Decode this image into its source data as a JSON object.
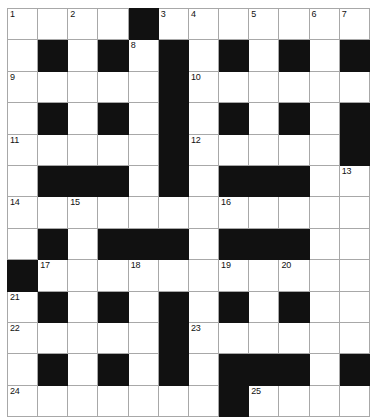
{
  "puzzle": {
    "title": "Crossword Grid",
    "columns": 12,
    "rows": 12,
    "block_color": "#111111",
    "cell_color": "#ffffff",
    "grid_line_color": "#a8a8a8",
    "number_color": "#111111",
    "numbers_visible": [
      1,
      2,
      3,
      4,
      5,
      6,
      7,
      8,
      9,
      10,
      11,
      12,
      13,
      14,
      15,
      16,
      17,
      18,
      19,
      20,
      21,
      22,
      23,
      24,
      25
    ],
    "grid": [
      [
        {
          "type": "white",
          "number": 1
        },
        {
          "type": "white"
        },
        {
          "type": "white",
          "number": 2
        },
        {
          "type": "white"
        },
        {
          "type": "block"
        },
        {
          "type": "white",
          "number": 3
        },
        {
          "type": "white",
          "number": 4
        },
        {
          "type": "white"
        },
        {
          "type": "white",
          "number": 5
        },
        {
          "type": "white"
        },
        {
          "type": "white",
          "number": 6
        },
        {
          "type": "white",
          "number": 7
        }
      ],
      [
        {
          "type": "white"
        },
        {
          "type": "block"
        },
        {
          "type": "white"
        },
        {
          "type": "block"
        },
        {
          "type": "white",
          "number": 8
        },
        {
          "type": "block"
        },
        {
          "type": "white"
        },
        {
          "type": "block"
        },
        {
          "type": "white"
        },
        {
          "type": "block"
        },
        {
          "type": "white"
        },
        {
          "type": "block"
        }
      ],
      [
        {
          "type": "white",
          "number": 9
        },
        {
          "type": "white"
        },
        {
          "type": "white"
        },
        {
          "type": "white"
        },
        {
          "type": "white"
        },
        {
          "type": "block"
        },
        {
          "type": "white",
          "number": 10
        },
        {
          "type": "white"
        },
        {
          "type": "white"
        },
        {
          "type": "white"
        },
        {
          "type": "white"
        },
        {
          "type": "white"
        }
      ],
      [
        {
          "type": "white"
        },
        {
          "type": "block"
        },
        {
          "type": "white"
        },
        {
          "type": "block"
        },
        {
          "type": "white"
        },
        {
          "type": "block"
        },
        {
          "type": "white"
        },
        {
          "type": "block"
        },
        {
          "type": "white"
        },
        {
          "type": "block"
        },
        {
          "type": "white"
        },
        {
          "type": "block"
        }
      ],
      [
        {
          "type": "white",
          "number": 11
        },
        {
          "type": "white"
        },
        {
          "type": "white"
        },
        {
          "type": "white"
        },
        {
          "type": "white"
        },
        {
          "type": "block"
        },
        {
          "type": "white",
          "number": 12
        },
        {
          "type": "white"
        },
        {
          "type": "white"
        },
        {
          "type": "white"
        },
        {
          "type": "white"
        },
        {
          "type": "block"
        }
      ],
      [
        {
          "type": "white"
        },
        {
          "type": "block"
        },
        {
          "type": "block"
        },
        {
          "type": "block"
        },
        {
          "type": "white"
        },
        {
          "type": "block"
        },
        {
          "type": "white"
        },
        {
          "type": "block"
        },
        {
          "type": "block"
        },
        {
          "type": "block"
        },
        {
          "type": "white"
        },
        {
          "type": "white",
          "number": 13
        }
      ],
      [
        {
          "type": "white",
          "number": 14
        },
        {
          "type": "white"
        },
        {
          "type": "white",
          "number": 15
        },
        {
          "type": "white"
        },
        {
          "type": "white"
        },
        {
          "type": "white"
        },
        {
          "type": "white"
        },
        {
          "type": "white",
          "number": 16
        },
        {
          "type": "white"
        },
        {
          "type": "white"
        },
        {
          "type": "white"
        },
        {
          "type": "white"
        }
      ],
      [
        {
          "type": "white"
        },
        {
          "type": "block"
        },
        {
          "type": "white"
        },
        {
          "type": "block"
        },
        {
          "type": "block"
        },
        {
          "type": "block"
        },
        {
          "type": "white"
        },
        {
          "type": "block"
        },
        {
          "type": "block"
        },
        {
          "type": "block"
        },
        {
          "type": "white"
        },
        {
          "type": "white"
        }
      ],
      [
        {
          "type": "block"
        },
        {
          "type": "white",
          "number": 17
        },
        {
          "type": "white"
        },
        {
          "type": "white"
        },
        {
          "type": "white",
          "number": 18
        },
        {
          "type": "white"
        },
        {
          "type": "white"
        },
        {
          "type": "white",
          "number": 19
        },
        {
          "type": "white"
        },
        {
          "type": "white",
          "number": 20
        },
        {
          "type": "white"
        },
        {
          "type": "white"
        }
      ],
      [
        {
          "type": "white",
          "number": 21
        },
        {
          "type": "block"
        },
        {
          "type": "white"
        },
        {
          "type": "block"
        },
        {
          "type": "white"
        },
        {
          "type": "block"
        },
        {
          "type": "white"
        },
        {
          "type": "block"
        },
        {
          "type": "white"
        },
        {
          "type": "block"
        },
        {
          "type": "white"
        },
        {
          "type": "white"
        }
      ],
      [
        {
          "type": "white",
          "number": 22
        },
        {
          "type": "white"
        },
        {
          "type": "white"
        },
        {
          "type": "white"
        },
        {
          "type": "white"
        },
        {
          "type": "block"
        },
        {
          "type": "white",
          "number": 23
        },
        {
          "type": "white"
        },
        {
          "type": "white"
        },
        {
          "type": "white"
        },
        {
          "type": "white"
        },
        {
          "type": "white"
        }
      ],
      [
        {
          "type": "white"
        },
        {
          "type": "block"
        },
        {
          "type": "white"
        },
        {
          "type": "block"
        },
        {
          "type": "white"
        },
        {
          "type": "block"
        },
        {
          "type": "white"
        },
        {
          "type": "block"
        },
        {
          "type": "block"
        },
        {
          "type": "block"
        },
        {
          "type": "white"
        },
        {
          "type": "block"
        }
      ],
      [
        {
          "type": "white",
          "number": 24
        },
        {
          "type": "white"
        },
        {
          "type": "white"
        },
        {
          "type": "white"
        },
        {
          "type": "white"
        },
        {
          "type": "white"
        },
        {
          "type": "white"
        },
        {
          "type": "block"
        },
        {
          "type": "white",
          "number": 25
        },
        {
          "type": "white"
        },
        {
          "type": "white"
        },
        {
          "type": "white"
        }
      ]
    ]
  }
}
